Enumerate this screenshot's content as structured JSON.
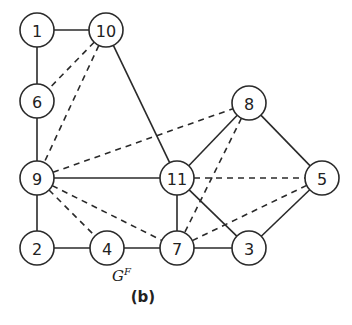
{
  "figure": {
    "caption": "(b)",
    "graph_name": "G",
    "graph_name_superscript": "F"
  },
  "graph": {
    "node_radius": 17,
    "nodes": [
      {
        "id": "1",
        "label": "1",
        "x": 37,
        "y": 30
      },
      {
        "id": "10",
        "label": "10",
        "x": 106,
        "y": 30
      },
      {
        "id": "6",
        "label": "6",
        "x": 37,
        "y": 101
      },
      {
        "id": "9",
        "label": "9",
        "x": 37,
        "y": 178
      },
      {
        "id": "2",
        "label": "2",
        "x": 37,
        "y": 248
      },
      {
        "id": "4",
        "label": "4",
        "x": 107,
        "y": 248
      },
      {
        "id": "7",
        "label": "7",
        "x": 177,
        "y": 248
      },
      {
        "id": "11",
        "label": "11",
        "x": 177,
        "y": 178
      },
      {
        "id": "8",
        "label": "8",
        "x": 249,
        "y": 103
      },
      {
        "id": "5",
        "label": "5",
        "x": 322,
        "y": 178
      },
      {
        "id": "3",
        "label": "3",
        "x": 249,
        "y": 248
      }
    ],
    "edges": [
      {
        "from": "1",
        "to": "10",
        "style": "solid"
      },
      {
        "from": "1",
        "to": "6",
        "style": "solid"
      },
      {
        "from": "6",
        "to": "9",
        "style": "solid"
      },
      {
        "from": "9",
        "to": "2",
        "style": "solid"
      },
      {
        "from": "2",
        "to": "4",
        "style": "solid"
      },
      {
        "from": "4",
        "to": "7",
        "style": "solid"
      },
      {
        "from": "7",
        "to": "3",
        "style": "solid"
      },
      {
        "from": "10",
        "to": "11",
        "style": "solid"
      },
      {
        "from": "9",
        "to": "11",
        "style": "solid"
      },
      {
        "from": "11",
        "to": "7",
        "style": "solid"
      },
      {
        "from": "11",
        "to": "8",
        "style": "solid"
      },
      {
        "from": "11",
        "to": "3",
        "style": "solid"
      },
      {
        "from": "8",
        "to": "5",
        "style": "solid"
      },
      {
        "from": "5",
        "to": "3",
        "style": "solid"
      },
      {
        "from": "10",
        "to": "6",
        "style": "dashed"
      },
      {
        "from": "10",
        "to": "9",
        "style": "dashed"
      },
      {
        "from": "9",
        "to": "8",
        "style": "dashed"
      },
      {
        "from": "9",
        "to": "4",
        "style": "dashed"
      },
      {
        "from": "9",
        "to": "7",
        "style": "dashed"
      },
      {
        "from": "8",
        "to": "7",
        "style": "dashed"
      },
      {
        "from": "11",
        "to": "5",
        "style": "dashed"
      },
      {
        "from": "7",
        "to": "5",
        "style": "dashed"
      }
    ]
  }
}
